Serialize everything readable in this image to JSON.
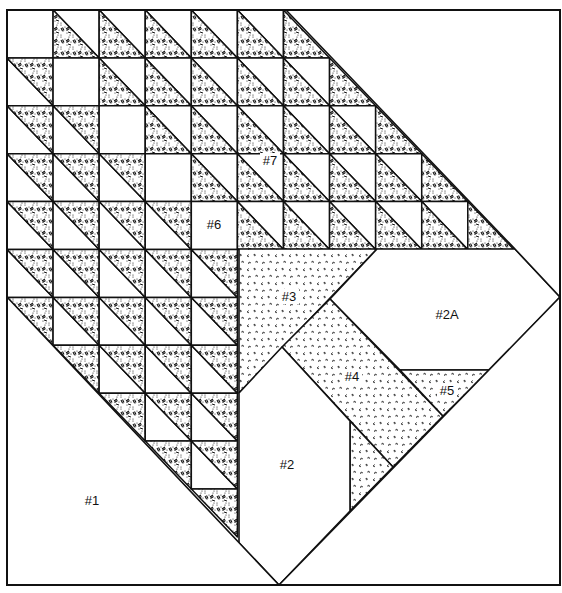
{
  "diagram": {
    "type": "quilt-block-pattern",
    "frame": {
      "x0": 7,
      "y0": 10,
      "x1": 560,
      "y1": 585
    },
    "grid": {
      "cols": 12,
      "rows": 12,
      "x0": 7,
      "dx": 46.08,
      "y0": 10,
      "dy": 47.9
    },
    "colors": {
      "line": "#111111",
      "background": "#ffffff",
      "dark_fabric": "#222222",
      "light_fabric": "#555555"
    },
    "fabrics": {
      "half_square_triangle": "dense-dot-dash-print",
      "pieces_3_4_5": "light-scattered-tick-print",
      "pieces_1_2_2A_6": "plain-white"
    },
    "labels": [
      {
        "id": "piece-1",
        "text": "#1",
        "x": 92,
        "y": 505
      },
      {
        "id": "piece-2",
        "text": "#2",
        "x": 287,
        "y": 469
      },
      {
        "id": "piece-2a",
        "text": "#2A",
        "x": 447,
        "y": 319
      },
      {
        "id": "piece-3",
        "text": "#3",
        "x": 289,
        "y": 301
      },
      {
        "id": "piece-4",
        "text": "#4",
        "x": 352,
        "y": 381
      },
      {
        "id": "piece-5",
        "text": "#5",
        "x": 447,
        "y": 395
      },
      {
        "id": "piece-6",
        "text": "#6",
        "x": 214,
        "y": 229
      },
      {
        "id": "piece-7",
        "text": "#7",
        "x": 270,
        "y": 165
      }
    ]
  }
}
